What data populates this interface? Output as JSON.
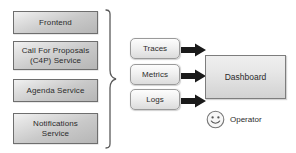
{
  "diagram": {
    "services": [
      {
        "label": "Frontend",
        "x": 13,
        "y": 11,
        "w": 85,
        "h": 23
      },
      {
        "label": "Call For Proposals\n(C4P) Service",
        "x": 13,
        "y": 41,
        "w": 85,
        "h": 29
      },
      {
        "label": "Agenda Service",
        "x": 13,
        "y": 79,
        "w": 85,
        "h": 23
      },
      {
        "label": "Notifications\nService",
        "x": 13,
        "y": 113,
        "w": 85,
        "h": 31
      }
    ],
    "signals": [
      {
        "label": "Traces",
        "x": 130,
        "y": 38,
        "w": 50,
        "h": 21
      },
      {
        "label": "Metrics",
        "x": 130,
        "y": 64,
        "w": 50,
        "h": 21
      },
      {
        "label": "Logs",
        "x": 130,
        "y": 89,
        "w": 50,
        "h": 21
      }
    ],
    "dashboard": {
      "label": "Dashboard",
      "x": 205,
      "y": 55,
      "w": 81,
      "h": 44
    },
    "arrows": [
      {
        "name": "traces-to-dashboard",
        "y": 43
      },
      {
        "name": "metrics-to-dashboard",
        "y": 69
      },
      {
        "name": "logs-to-dashboard",
        "y": 94
      }
    ],
    "operator": {
      "label": "Operator",
      "icon": "smiley-face-icon",
      "x": 206,
      "y": 110
    },
    "brace": {
      "name": "grouping-brace",
      "x": 103,
      "y": 10,
      "w": 14,
      "h": 138
    },
    "colors": {
      "background": "#ffffff",
      "box_border": "#6e6e6e",
      "signal_border": "#9a9a9a",
      "arrow": "#1a1a1a",
      "text": "#2b2b2b"
    }
  }
}
